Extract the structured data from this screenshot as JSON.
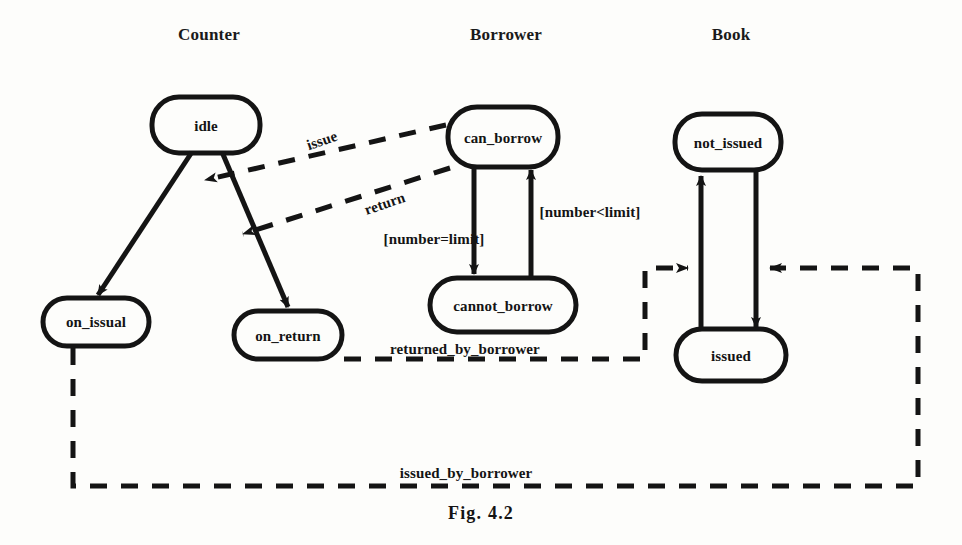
{
  "figure": {
    "caption": "Fig. 4.2",
    "caption_x": 481,
    "caption_y": 513,
    "background": "#fdfdfb",
    "ink": "#141414"
  },
  "columns": [
    {
      "id": "counter",
      "label": "Counter",
      "x": 209,
      "y": 33
    },
    {
      "id": "borrower",
      "label": "Borrower",
      "x": 506,
      "y": 33
    },
    {
      "id": "book",
      "label": "Book",
      "x": 731,
      "y": 33
    }
  ],
  "states": [
    {
      "id": "idle",
      "label": "idle",
      "column": "counter",
      "cx": 206,
      "cy": 125,
      "w": 108,
      "h": 56
    },
    {
      "id": "on_issual",
      "label": "on_issual",
      "column": "counter",
      "cx": 96,
      "cy": 322,
      "w": 106,
      "h": 48
    },
    {
      "id": "on_return",
      "label": "on_return",
      "column": "counter",
      "cx": 288,
      "cy": 335,
      "w": 108,
      "h": 48
    },
    {
      "id": "can_borrow",
      "label": "can_borrow",
      "column": "borrower",
      "cx": 503,
      "cy": 137,
      "w": 110,
      "h": 60
    },
    {
      "id": "cannot_borrow",
      "label": "cannot_borrow",
      "column": "borrower",
      "cx": 503,
      "cy": 305,
      "w": 146,
      "h": 54
    },
    {
      "id": "not_issued",
      "label": "not_issued",
      "column": "book",
      "cx": 728,
      "cy": 142,
      "w": 106,
      "h": 56
    },
    {
      "id": "issued",
      "label": "issued",
      "column": "book",
      "cx": 731,
      "cy": 355,
      "w": 110,
      "h": 52
    }
  ],
  "edge_labels": [
    {
      "id": "issue",
      "text": "issue",
      "x": 322,
      "y": 141,
      "rotated": true
    },
    {
      "id": "return",
      "text": "return",
      "x": 385,
      "y": 204,
      "rotated": true
    },
    {
      "id": "number_equals_limit",
      "text": "[number=limit]",
      "x": 434,
      "y": 239,
      "rotated": false
    },
    {
      "id": "number_less_limit",
      "text": "[number<limit]",
      "x": 590,
      "y": 212,
      "rotated": false
    },
    {
      "id": "returned_by_borrower",
      "text": "returned_by_borrower",
      "x": 465,
      "y": 349,
      "rotated": false
    },
    {
      "id": "issued_by_borrower",
      "text": "issued_by_borrower",
      "x": 466,
      "y": 473,
      "rotated": false
    }
  ],
  "transitions": [
    {
      "id": "idle-to-on_issual",
      "style": "solid",
      "from": "idle",
      "to": "on_issual",
      "arrow": "end"
    },
    {
      "id": "idle-to-on_return",
      "style": "solid",
      "from": "idle",
      "to": "on_return",
      "arrow": "end"
    },
    {
      "id": "issue-can_borrow-to-idle",
      "style": "dashed",
      "from": "can_borrow",
      "to": "idle",
      "arrow": "end",
      "label": "issue"
    },
    {
      "id": "return-can_borrow-to-idle",
      "style": "dashed",
      "from": "can_borrow",
      "to": "idle",
      "arrow": "end",
      "label": "return"
    },
    {
      "id": "can_borrow-to-cannot_borrow",
      "style": "solid",
      "from": "can_borrow",
      "to": "cannot_borrow",
      "arrow": "end",
      "label": "[number=limit]"
    },
    {
      "id": "cannot_borrow-to-can_borrow",
      "style": "solid",
      "from": "cannot_borrow",
      "to": "can_borrow",
      "arrow": "end",
      "label": "[number<limit]"
    },
    {
      "id": "issued-to-not_issued",
      "style": "solid",
      "from": "issued",
      "to": "not_issued",
      "arrow": "end"
    },
    {
      "id": "not_issued-to-issued",
      "style": "solid",
      "from": "not_issued",
      "to": "issued",
      "arrow": "end"
    },
    {
      "id": "returned_by_borrower-signal",
      "style": "dashed",
      "from": "on_return",
      "to": "book-column",
      "arrow": "end",
      "label": "returned_by_borrower"
    },
    {
      "id": "issued_by_borrower-signal",
      "style": "dashed",
      "from": "on_issual",
      "to": "book-column",
      "arrow": "end",
      "label": "issued_by_borrower"
    }
  ]
}
